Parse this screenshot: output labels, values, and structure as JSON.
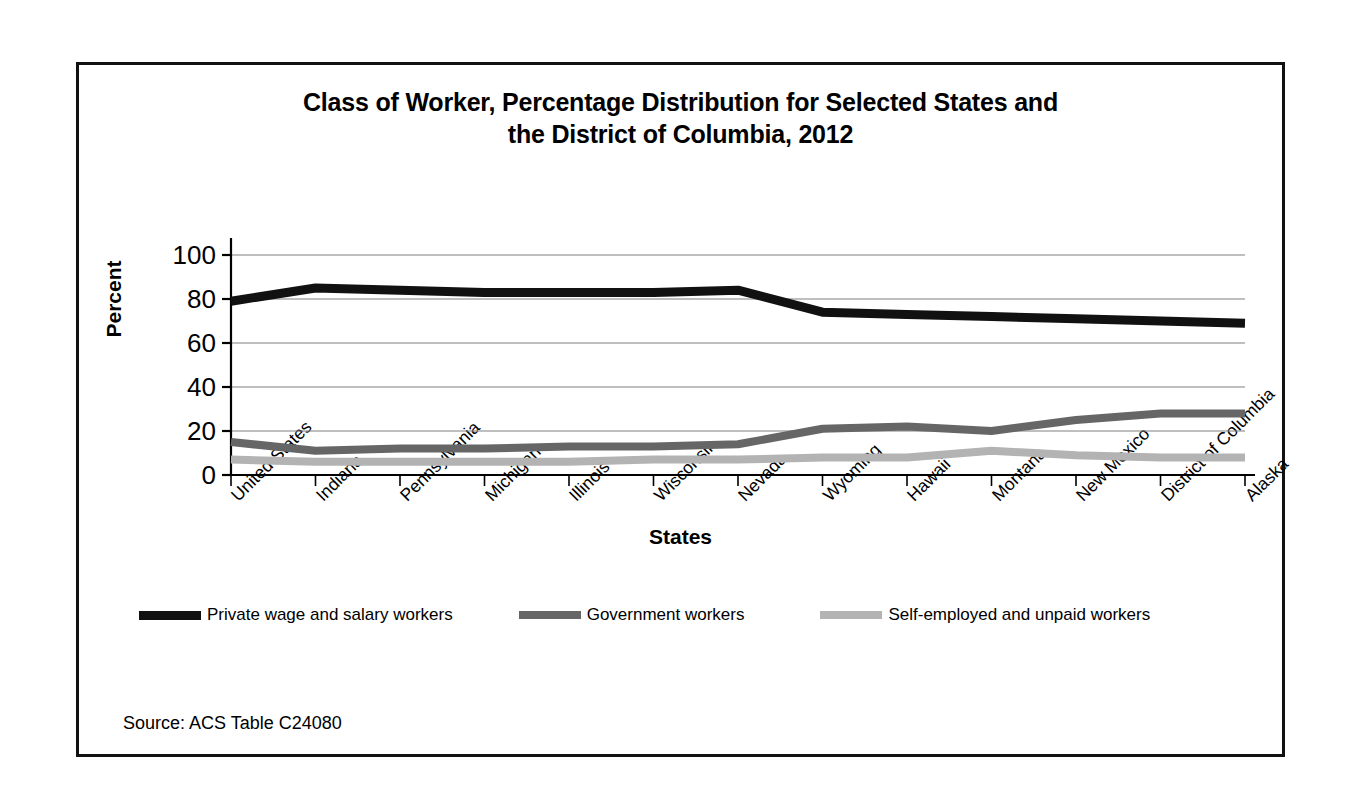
{
  "chart_data": {
    "type": "line",
    "title": "Class of Worker, Percentage Distribution for Selected States and the District of Columbia, 2012",
    "title_line1": "Class of Worker, Percentage Distribution for Selected States and",
    "title_line2": "the District of Columbia, 2012",
    "xlabel": "States",
    "ylabel": "Percent",
    "ylim": [
      0,
      100
    ],
    "yticks": [
      0,
      20,
      40,
      60,
      80,
      100
    ],
    "grid": "horizontal",
    "legend_position": "bottom",
    "categories": [
      "United States",
      "Indiana",
      "Pennsylvania",
      "Michigan",
      "Illinois",
      "Wisconsin",
      "Nevada",
      "Wyoming",
      "Hawaii",
      "Montana",
      "New Mexico",
      "District of Columbia",
      "Alaska"
    ],
    "series": [
      {
        "name": "Private wage and salary workers",
        "color": "#111111",
        "values": [
          79,
          85,
          84,
          83,
          83,
          83,
          84,
          74,
          73,
          72,
          71,
          70,
          69
        ]
      },
      {
        "name": "Government workers",
        "color": "#666666",
        "values": [
          15,
          11,
          12,
          12,
          13,
          13,
          14,
          21,
          22,
          20,
          25,
          28,
          28
        ]
      },
      {
        "name": "Self-employed and unpaid workers",
        "color": "#b3b3b3",
        "values": [
          7,
          6,
          6,
          6,
          6,
          7,
          7,
          8,
          8,
          11,
          9,
          8,
          8
        ]
      }
    ]
  },
  "source": {
    "note": "Source: ACS Table C24080"
  }
}
